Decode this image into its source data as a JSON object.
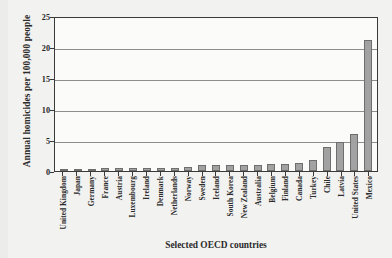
{
  "chart_data": {
    "type": "bar",
    "title": "",
    "xlabel": "Selected OECD countries",
    "ylabel": "Annual homicides per 100,000 people",
    "ylim": [
      0,
      25
    ],
    "yticks": [
      0,
      5,
      10,
      15,
      20,
      25
    ],
    "grid": true,
    "legend": null,
    "bar_color": "#a2a2a2",
    "bar_edge_color": "#6e6e6e",
    "categories": [
      "United Kingdom",
      "Japan",
      "Germany",
      "France",
      "Austria",
      "Luxembourg",
      "Ireland",
      "Denmark",
      "Netherlands",
      "Norway",
      "Sweden",
      "Iceland",
      "South Korea",
      "New Zealand",
      "Australia",
      "Belgium",
      "Finland",
      "Canada",
      "Turkey",
      "Chile",
      "Latvia",
      "United States",
      "Mexico"
    ],
    "values": [
      0.1,
      0.2,
      0.4,
      0.5,
      0.5,
      0.5,
      0.5,
      0.5,
      0.5,
      0.6,
      0.9,
      0.9,
      0.9,
      1.0,
      1.0,
      1.1,
      1.1,
      1.3,
      1.8,
      3.9,
      4.7,
      5.9,
      21.2
    ]
  }
}
